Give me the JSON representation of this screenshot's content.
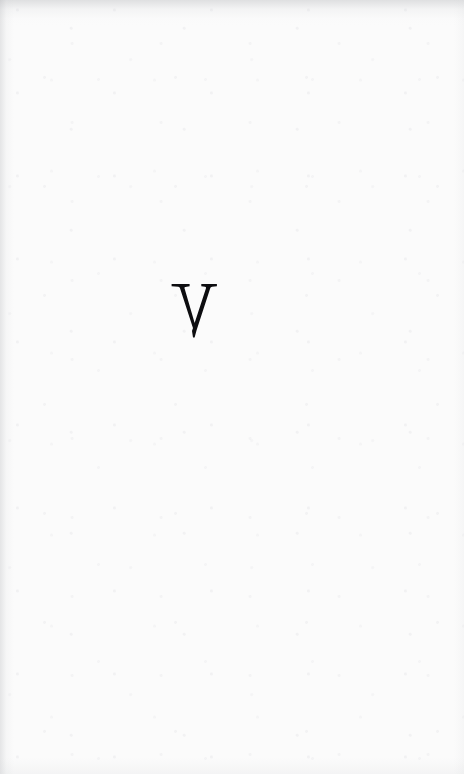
{
  "document": {
    "kind": "scanned-book-page",
    "page_type": "part-divider",
    "width": 464,
    "height": 774,
    "paper_color": "#fbfbfb",
    "ink_color": "#0d0d10"
  },
  "content": {
    "numeral": {
      "text": "V",
      "arabic_value": 5,
      "style": "roman-numeral-capital",
      "typeface_style": "old-style-serif",
      "color": "#0d0d10"
    }
  },
  "header": {
    "running_head": "",
    "visible": false
  },
  "footer": {
    "page_number": "",
    "visible": false
  },
  "artifacts": {
    "top_edge_shadow": true,
    "left_gutter_shadow": true,
    "right_edge_shadow": true,
    "bottom_edge_shadow": true,
    "paper_texture": true
  }
}
